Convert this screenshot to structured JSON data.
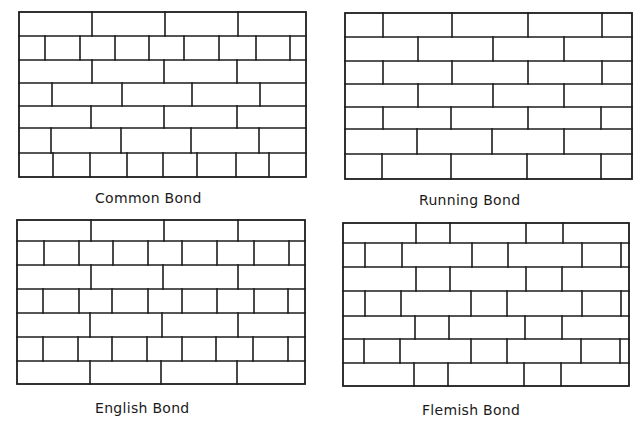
{
  "panels": [
    {
      "id": "common",
      "caption": "Common Bond",
      "caption_pos": {
        "x": 95,
        "y": 198
      },
      "frame": {
        "left": 19,
        "right": 306,
        "top": 12,
        "bottom": 177
      },
      "rows": [
        {
          "top": 12,
          "bottom": 36,
          "joints": [
            92,
            165,
            238
          ]
        },
        {
          "top": 36,
          "bottom": 60,
          "joints": [
            45,
            80,
            115,
            149,
            184,
            219,
            256,
            290
          ]
        },
        {
          "top": 60,
          "bottom": 83,
          "joints": [
            92,
            164,
            237
          ]
        },
        {
          "top": 83,
          "bottom": 106,
          "joints": [
            52,
            122,
            192,
            260
          ]
        },
        {
          "top": 106,
          "bottom": 128,
          "joints": [
            91,
            164,
            237
          ]
        },
        {
          "top": 128,
          "bottom": 153,
          "joints": [
            51,
            121,
            191,
            259
          ]
        },
        {
          "top": 153,
          "bottom": 177,
          "joints": [
            53,
            90,
            127,
            163,
            197,
            236,
            269
          ]
        }
      ]
    },
    {
      "id": "running",
      "caption": "Running Bond",
      "caption_pos": {
        "x": 419,
        "y": 200
      },
      "frame": {
        "left": 345,
        "right": 632,
        "top": 13,
        "bottom": 179
      },
      "rows": [
        {
          "top": 13,
          "bottom": 37,
          "joints": [
            383,
            452,
            528,
            602
          ]
        },
        {
          "top": 37,
          "bottom": 61,
          "joints": [
            418,
            493,
            564
          ]
        },
        {
          "top": 61,
          "bottom": 84,
          "joints": [
            383,
            452,
            528,
            602
          ]
        },
        {
          "top": 84,
          "bottom": 107,
          "joints": [
            418,
            493,
            564
          ]
        },
        {
          "top": 107,
          "bottom": 129,
          "joints": [
            383,
            451,
            528,
            601
          ]
        },
        {
          "top": 129,
          "bottom": 154,
          "joints": [
            417,
            492,
            564
          ]
        },
        {
          "top": 154,
          "bottom": 179,
          "joints": [
            382,
            451,
            527,
            601
          ]
        }
      ]
    },
    {
      "id": "english",
      "caption": "English Bond",
      "caption_pos": {
        "x": 95,
        "y": 408
      },
      "frame": {
        "left": 17,
        "right": 305,
        "top": 220,
        "bottom": 384
      },
      "rows": [
        {
          "top": 220,
          "bottom": 241,
          "joints": [
            91,
            164,
            238
          ]
        },
        {
          "top": 241,
          "bottom": 265,
          "joints": [
            44,
            79,
            113,
            148,
            182,
            217,
            254,
            289
          ]
        },
        {
          "top": 265,
          "bottom": 289,
          "joints": [
            91,
            163,
            238
          ]
        },
        {
          "top": 289,
          "bottom": 313,
          "joints": [
            43,
            79,
            112,
            148,
            182,
            217,
            254,
            288
          ]
        },
        {
          "top": 313,
          "bottom": 337,
          "joints": [
            90,
            162,
            238
          ]
        },
        {
          "top": 337,
          "bottom": 361,
          "joints": [
            43,
            78,
            112,
            147,
            182,
            216,
            253,
            288
          ]
        },
        {
          "top": 361,
          "bottom": 384,
          "joints": [
            90,
            161,
            237
          ]
        }
      ]
    },
    {
      "id": "flemish",
      "caption": "Flemish Bond",
      "caption_pos": {
        "x": 422,
        "y": 410
      },
      "frame": {
        "left": 343,
        "right": 629,
        "top": 223,
        "bottom": 386
      },
      "rows": [
        {
          "top": 223,
          "bottom": 243,
          "joints": [
            416,
            450,
            526,
            563
          ]
        },
        {
          "top": 243,
          "bottom": 267,
          "joints": [
            365,
            402,
            472,
            508,
            582,
            621
          ]
        },
        {
          "top": 267,
          "bottom": 291,
          "joints": [
            416,
            450,
            526,
            562
          ]
        },
        {
          "top": 291,
          "bottom": 316,
          "joints": [
            365,
            401,
            471,
            507,
            582,
            621
          ]
        },
        {
          "top": 316,
          "bottom": 339,
          "joints": [
            415,
            449,
            525,
            562
          ]
        },
        {
          "top": 339,
          "bottom": 363,
          "joints": [
            364,
            400,
            471,
            507,
            581,
            620
          ]
        },
        {
          "top": 363,
          "bottom": 386,
          "joints": [
            414,
            448,
            524,
            561
          ]
        }
      ]
    }
  ],
  "style": {
    "line_color": "#1c1c1c",
    "background": "#ffffff"
  }
}
